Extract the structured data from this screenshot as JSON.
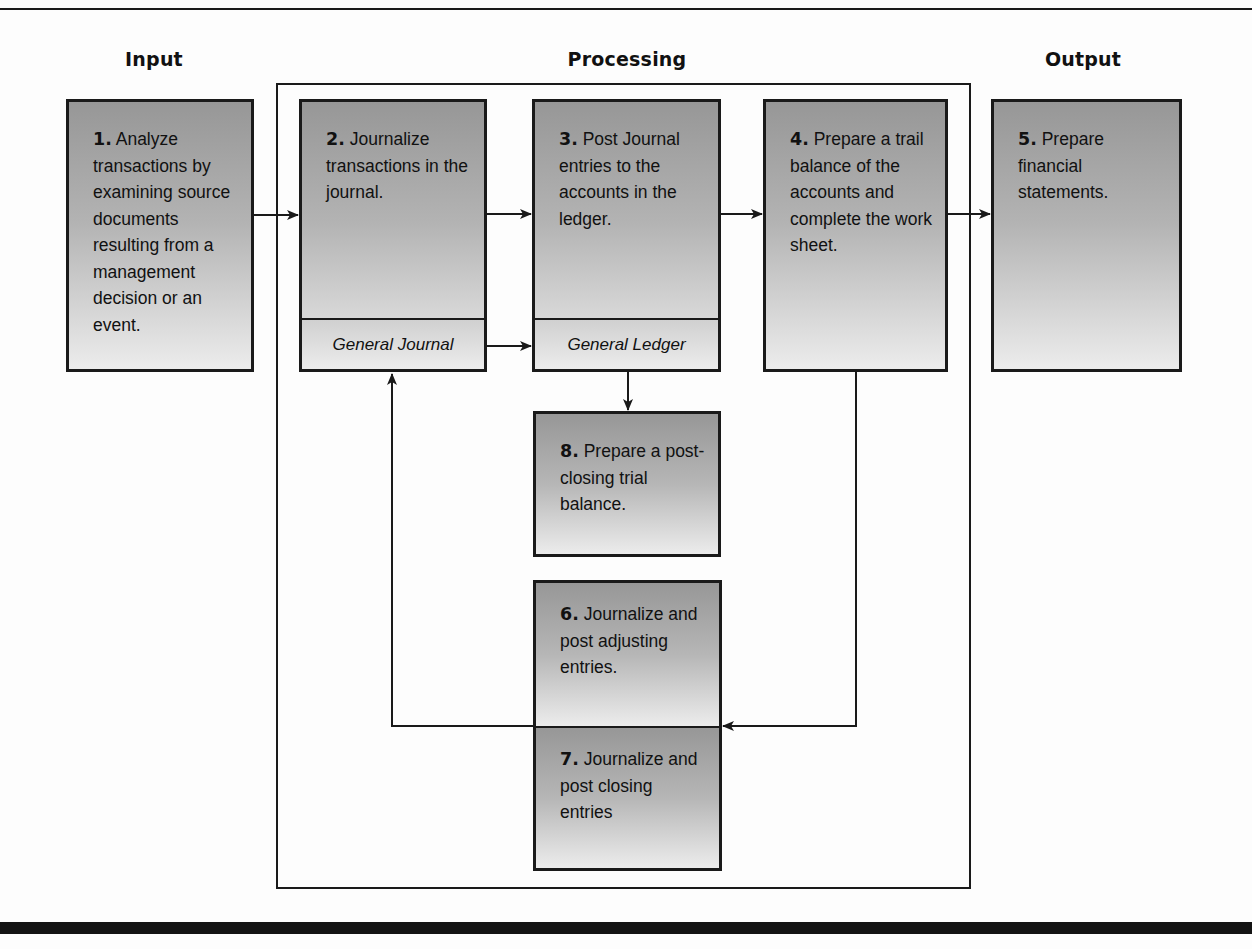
{
  "headings": {
    "input": "Input",
    "processing": "Processing",
    "output": "Output"
  },
  "steps": [
    {
      "id": 1,
      "num": "1.",
      "text": " Analyze transactions by examining source documents resulting from a management decision or an event.",
      "sub": null
    },
    {
      "id": 2,
      "num": "2.",
      "text": " Journalize transactions in the journal.",
      "sub": "General Journal"
    },
    {
      "id": 3,
      "num": "3.",
      "text": " Post Journal entries to the accounts in the ledger.",
      "sub": "General Ledger"
    },
    {
      "id": 4,
      "num": "4.",
      "text": " Prepare a trail balance of the accounts and complete the work sheet.",
      "sub": null
    },
    {
      "id": 5,
      "num": "5.",
      "text": " Prepare financial statements.",
      "sub": null
    },
    {
      "id": 6,
      "num": "6.",
      "text": " Journalize and post adjusting entries.",
      "sub": null
    },
    {
      "id": 7,
      "num": "7.",
      "text": " Journalize and post closing entries",
      "sub": null
    },
    {
      "id": 8,
      "num": "8.",
      "text": " Prepare a post-closing trial balance.",
      "sub": null
    }
  ],
  "flows": [
    {
      "from": 1,
      "to": 2
    },
    {
      "from": 2,
      "to": 3
    },
    {
      "from": "General Journal",
      "to": "General Ledger"
    },
    {
      "from": 3,
      "to": 4
    },
    {
      "from": 4,
      "to": 5
    },
    {
      "from": 3,
      "to": 8
    },
    {
      "from": 4,
      "to": "6/7"
    },
    {
      "from": "6/7",
      "to": 2
    }
  ],
  "colors": {
    "stroke": "#1a1a1a",
    "box_top": "#979797",
    "box_bottom": "#ececec",
    "background": "#fdfdfd"
  }
}
